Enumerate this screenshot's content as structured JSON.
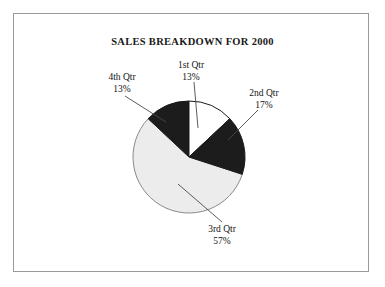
{
  "figure": {
    "frame_border_color": "#9a9a9a",
    "background_color": "#ffffff"
  },
  "chart_data": {
    "type": "pie",
    "title": "SALES BREAKDOWN FOR 2000",
    "xlabel": "",
    "ylabel": "",
    "legend": "none",
    "grid": false,
    "start_angle_deg": 0,
    "direction": "clockwise",
    "categories": [
      "1st Qtr",
      "2nd Qtr",
      "3rd Qtr",
      "4th Qtr"
    ],
    "values": [
      13,
      17,
      57,
      13
    ],
    "value_unit": "%",
    "slices": [
      {
        "name": "1st Qtr",
        "percent": 13,
        "percent_label": "13%",
        "fill": "#ffffff",
        "stroke": "#1a1a1a",
        "start_deg": 0,
        "end_deg": 46.8
      },
      {
        "name": "2nd Qtr",
        "percent": 17,
        "percent_label": "17%",
        "fill": "#1c1c1c",
        "stroke": "#1a1a1a",
        "start_deg": 46.8,
        "end_deg": 108.0
      },
      {
        "name": "3rd Qtr",
        "percent": 57,
        "percent_label": "57%",
        "fill": "#ececec",
        "stroke": "#8a8a8a",
        "start_deg": 108.0,
        "end_deg": 313.2
      },
      {
        "name": "4th Qtr",
        "percent": 13,
        "percent_label": "13%",
        "fill": "#1c1c1c",
        "stroke": "#1a1a1a",
        "start_deg": 313.2,
        "end_deg": 360.0
      }
    ]
  },
  "labels": {
    "q1": {
      "name": "1st Qtr",
      "percent": "13%"
    },
    "q2": {
      "name": "2nd Qtr",
      "percent": "17%"
    },
    "q3": {
      "name": "3rd Qtr",
      "percent": "57%"
    },
    "q4": {
      "name": "4th Qtr",
      "percent": "13%"
    }
  }
}
